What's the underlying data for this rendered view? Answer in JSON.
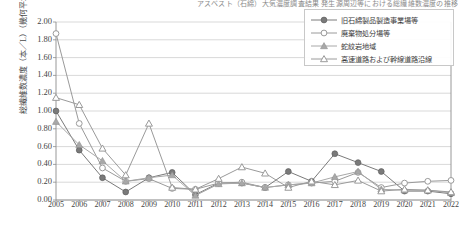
{
  "title": "アスベスト（石綿）大気濃度調査結果 発生源周辺等における総繊維数濃度の推移",
  "axis": {
    "y_title": "総繊維数濃度（本／L）（幾何平均値）",
    "y_ticks": [
      "2.00",
      "1.80",
      "1.60",
      "1.40",
      "1.20",
      "1.00",
      "0.80",
      "0.60",
      "0.40",
      "0.20",
      "0.00"
    ],
    "y_min": 0.0,
    "y_max": 2.0,
    "x_ticks": [
      "2005",
      "2006",
      "2007",
      "2008",
      "2009",
      "2010",
      "2011",
      "2012",
      "2013",
      "2014",
      "2015",
      "2016",
      "2017",
      "2018",
      "2019",
      "2020",
      "2021",
      "2022"
    ]
  },
  "legend": {
    "position": "top-right",
    "items": [
      {
        "label": "旧石綿製品製造事業場等",
        "marker": "filled-circle",
        "color": "#7a7a7a"
      },
      {
        "label": "廃棄物処分場等",
        "marker": "open-circle",
        "color": "#9a9a9a"
      },
      {
        "label": "蛇紋岩地域",
        "marker": "filled-triangle",
        "color": "#a8a8a8"
      },
      {
        "label": "高速道路および幹線道路沿線",
        "marker": "open-triangle",
        "color": "#9a9a9a"
      }
    ]
  },
  "chart_data": {
    "type": "line",
    "title": "アスベスト（石綿）大気濃度調査結果 発生源周辺等における総繊維数濃度の推移",
    "xlabel": "",
    "ylabel": "総繊維数濃度（本／L）（幾何平均値）",
    "ylim": [
      0.0,
      2.0
    ],
    "ytick_step": 0.2,
    "grid": true,
    "legend_position": "top-right",
    "categories": [
      "2005",
      "2006",
      "2007",
      "2008",
      "2009",
      "2010",
      "2011",
      "2012",
      "2013",
      "2014",
      "2015",
      "2016",
      "2017",
      "2018",
      "2019",
      "2020",
      "2021",
      "2022"
    ],
    "series": [
      {
        "name": "旧石綿製品製造事業場等",
        "marker": "filled-circle",
        "color": "#7a7a7a",
        "values": [
          1.0,
          0.56,
          0.25,
          0.09,
          0.25,
          0.31,
          0.06,
          0.19,
          0.19,
          0.14,
          0.32,
          0.21,
          0.52,
          0.42,
          0.32,
          0.1,
          0.1,
          0.07
        ]
      },
      {
        "name": "廃棄物処分場等",
        "marker": "open-circle",
        "color": "#9a9a9a",
        "values": [
          1.87,
          0.86,
          0.36,
          0.21,
          0.24,
          0.13,
          0.12,
          0.19,
          0.2,
          0.14,
          0.17,
          0.19,
          0.21,
          0.31,
          0.14,
          0.19,
          0.21,
          0.22
        ]
      },
      {
        "name": "蛇紋岩地域",
        "marker": "filled-triangle",
        "color": "#a8a8a8",
        "values": [
          0.88,
          0.62,
          0.44,
          0.21,
          0.25,
          0.28,
          0.05,
          0.18,
          0.19,
          0.14,
          0.17,
          0.19,
          0.26,
          0.32,
          0.12,
          0.11,
          0.11,
          0.08
        ]
      },
      {
        "name": "高速道路および幹線道路沿線",
        "marker": "open-triangle",
        "color": "#9a9a9a",
        "values": [
          1.15,
          1.07,
          0.58,
          0.28,
          0.86,
          0.14,
          0.12,
          0.24,
          0.37,
          0.3,
          0.14,
          0.21,
          0.17,
          0.22,
          0.1,
          0.12,
          0.11,
          0.09
        ]
      }
    ]
  }
}
